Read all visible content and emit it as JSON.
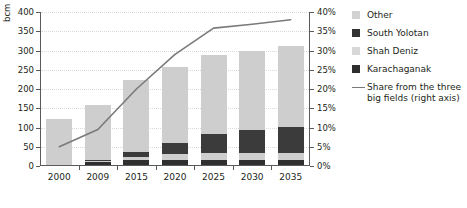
{
  "title": "",
  "axes": {
    "y_left_label": "bcm",
    "y_left_ticks": [
      "0",
      "50",
      "100",
      "150",
      "200",
      "250",
      "300",
      "350",
      "400"
    ],
    "y_right_ticks": [
      "0%",
      "5%",
      "10%",
      "15%",
      "20%",
      "25%",
      "30%",
      "35%",
      "40%"
    ],
    "x_ticks": [
      "2000",
      "2009",
      "2015",
      "2020",
      "2025",
      "2030",
      "2035"
    ]
  },
  "legend": {
    "items": [
      {
        "label": "Other",
        "swatch": "#d2d2d2",
        "type": "bar"
      },
      {
        "label": "South Yolotan",
        "swatch": "#333333",
        "type": "bar"
      },
      {
        "label": "Shah Deniz",
        "swatch": "#d8d8d8",
        "type": "bar"
      },
      {
        "label": "Karachaganak",
        "swatch": "#2e2e2e",
        "type": "bar"
      },
      {
        "label": "Share from the three big fields (right axis)",
        "swatch": "#7a7a7a",
        "type": "line"
      }
    ]
  },
  "chart_data": {
    "type": "bar",
    "title": "",
    "xlabel": "",
    "ylabel": "bcm",
    "ylim": [
      0,
      400
    ],
    "y2lim": [
      0,
      40
    ],
    "y2label": "%",
    "grid": true,
    "legend_position": "right",
    "categories": [
      "2000",
      "2009",
      "2015",
      "2020",
      "2025",
      "2030",
      "2035"
    ],
    "stacked": true,
    "stack_order_bottom_to_top": [
      "Karachaganak",
      "Shah Deniz",
      "South Yolotan",
      "Other"
    ],
    "series": [
      {
        "name": "Karachaganak",
        "color": "#2e2e2e",
        "axis": "left",
        "values": [
          0,
          8,
          12,
          14,
          14,
          14,
          14
        ]
      },
      {
        "name": "Shah Deniz",
        "color": "#d8d8d8",
        "axis": "left",
        "values": [
          0,
          2,
          10,
          14,
          16,
          16,
          16
        ]
      },
      {
        "name": "South Yolotan",
        "color": "#333333",
        "axis": "left",
        "values": [
          0,
          2,
          12,
          30,
          50,
          62,
          70
        ]
      },
      {
        "name": "Other",
        "color": "#cecece",
        "axis": "left",
        "values": [
          120,
          143,
          188,
          197,
          205,
          203,
          210
        ]
      },
      {
        "name": "Share from the three big fields (right axis)",
        "color": "#7a7a7a",
        "axis": "right",
        "type": "line",
        "values": [
          5.0,
          9.5,
          20.0,
          29.0,
          35.8,
          36.8,
          38.0
        ]
      }
    ],
    "totals": [
      120,
      155,
      222,
      255,
      285,
      295,
      310
    ]
  }
}
